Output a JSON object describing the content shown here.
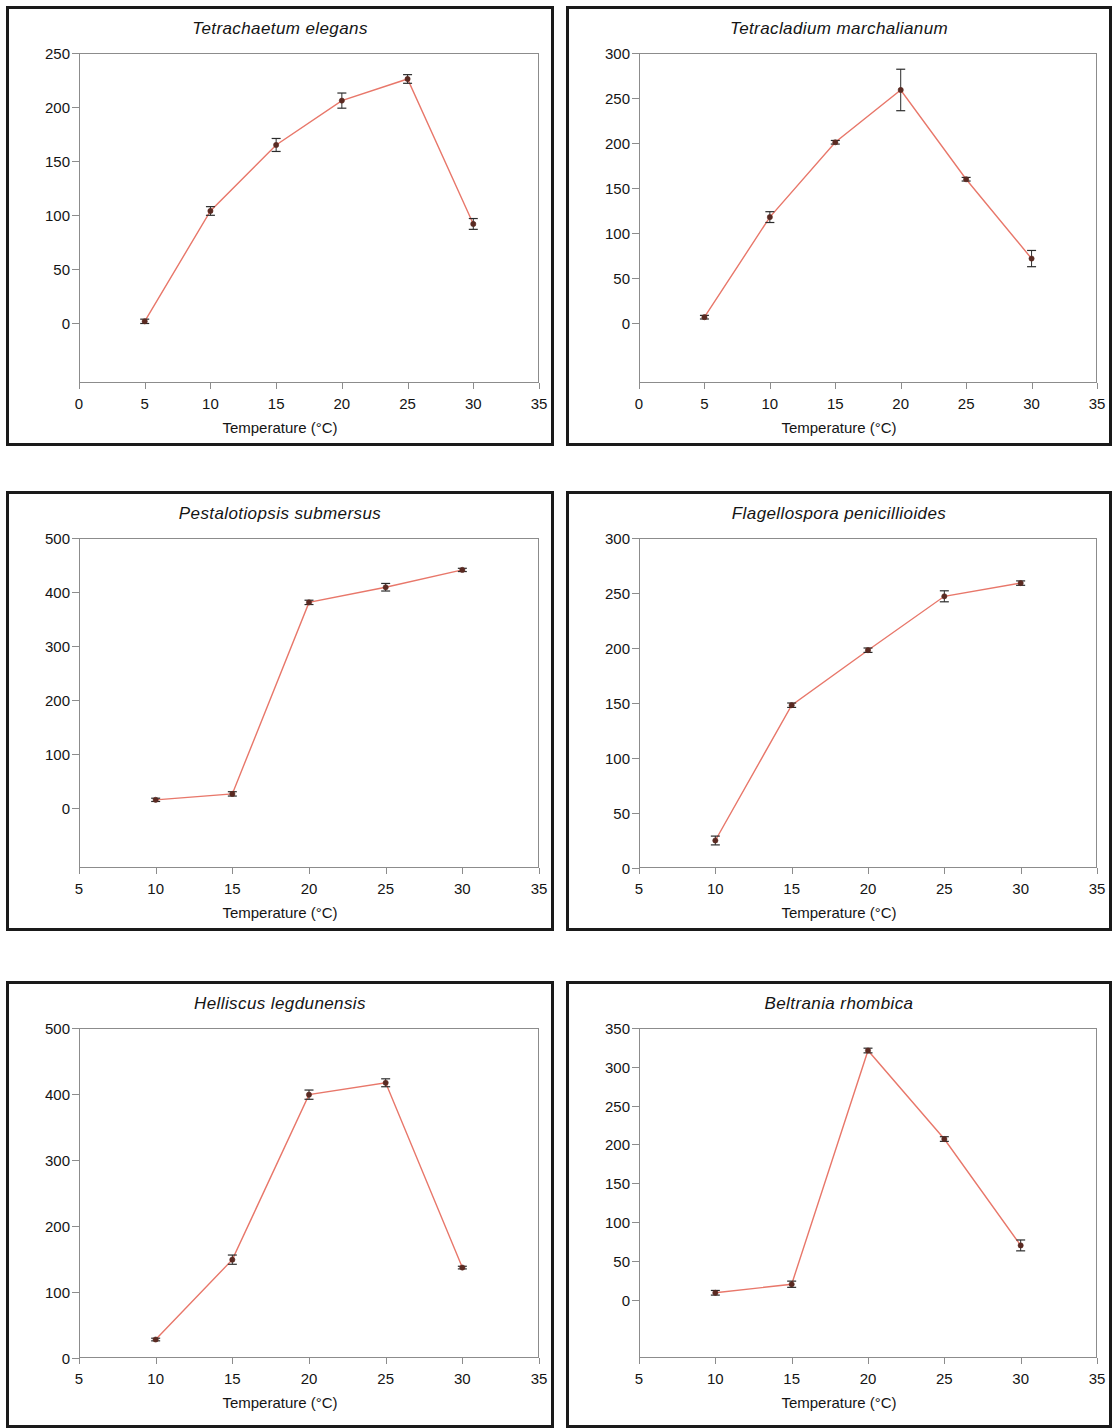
{
  "figure": {
    "x_axis_label": "Temperature (°C)",
    "line_color": "#e8776a",
    "marker_color": "#5a2a22",
    "error_bar_color": "#2b2b2b",
    "axis_color": "#8c8c8c",
    "frame_color": "#1a1a1a",
    "panel_count": 6
  },
  "chart_data": [
    {
      "id": "tetrachaetum-elegans",
      "type": "line",
      "title": "Tetrachaetum elegans",
      "xlabel": "Temperature (°C)",
      "ylabel": "",
      "xlim": [
        0,
        35
      ],
      "ylim": [
        -55,
        250
      ],
      "y_axis_display_min": 0,
      "xticks": [
        0,
        5,
        10,
        15,
        20,
        25,
        30,
        35
      ],
      "yticks": [
        0,
        50,
        100,
        150,
        200,
        250
      ],
      "grid": false,
      "legend": false,
      "x": [
        5,
        10,
        15,
        20,
        25,
        30
      ],
      "values": [
        2,
        104,
        165,
        206,
        226,
        92
      ],
      "errors": [
        2,
        4,
        6,
        7,
        4,
        5
      ]
    },
    {
      "id": "tetracladium-marchalianum",
      "type": "line",
      "title": "Tetracladium marchalianum",
      "xlabel": "Temperature (°C)",
      "ylabel": "",
      "xlim": [
        0,
        35
      ],
      "ylim": [
        -66,
        300
      ],
      "y_axis_display_min": 0,
      "xticks": [
        0,
        5,
        10,
        15,
        20,
        25,
        30,
        35
      ],
      "yticks": [
        0,
        50,
        100,
        150,
        200,
        250,
        300
      ],
      "grid": false,
      "legend": false,
      "x": [
        5,
        10,
        15,
        20,
        25,
        30
      ],
      "values": [
        7,
        118,
        201,
        259,
        160,
        72
      ],
      "errors": [
        2,
        6,
        2,
        23,
        2,
        9
      ]
    },
    {
      "id": "pestalotiopsis-submersus",
      "type": "line",
      "title": "Pestalotiopsis submersus",
      "xlabel": "Temperature (°C)",
      "ylabel": "",
      "xlim": [
        5,
        35
      ],
      "ylim": [
        -110,
        500
      ],
      "y_axis_display_min": 0,
      "xticks": [
        5,
        10,
        15,
        20,
        25,
        30,
        35
      ],
      "yticks": [
        0,
        100,
        200,
        300,
        400,
        500
      ],
      "grid": false,
      "legend": false,
      "x": [
        10,
        15,
        20,
        25,
        30
      ],
      "values": [
        16,
        27,
        381,
        409,
        441
      ],
      "errors": [
        3,
        4,
        4,
        7,
        3
      ]
    },
    {
      "id": "flagellospora-penicillioides",
      "type": "line",
      "title": "Flagellospora penicillioides",
      "xlabel": "Temperature (°C)",
      "ylabel": "",
      "xlim": [
        5,
        35
      ],
      "ylim": [
        0,
        300
      ],
      "y_axis_display_min": 0,
      "xticks": [
        5,
        10,
        15,
        20,
        25,
        30,
        35
      ],
      "yticks": [
        0,
        50,
        100,
        150,
        200,
        250,
        300
      ],
      "grid": false,
      "legend": false,
      "x": [
        10,
        15,
        20,
        25,
        30
      ],
      "values": [
        25,
        148,
        198,
        247,
        259
      ],
      "errors": [
        4,
        2,
        2,
        5,
        2
      ]
    },
    {
      "id": "helliscus-legdunensis",
      "type": "line",
      "title": "Helliscus legdunensis",
      "xlabel": "Temperature (°C)",
      "ylabel": "",
      "xlim": [
        5,
        35
      ],
      "ylim": [
        0,
        500
      ],
      "y_axis_display_min": 0,
      "xticks": [
        5,
        10,
        15,
        20,
        25,
        30,
        35
      ],
      "yticks": [
        0,
        100,
        200,
        300,
        400,
        500
      ],
      "grid": false,
      "legend": false,
      "x": [
        10,
        15,
        20,
        25,
        30
      ],
      "values": [
        28,
        149,
        399,
        417,
        137
      ],
      "errors": [
        2,
        7,
        7,
        6,
        2
      ]
    },
    {
      "id": "beltrania-rhombica",
      "type": "line",
      "title": "Beltrania rhombica",
      "xlabel": "Temperature (°C)",
      "ylabel": "",
      "xlim": [
        5,
        35
      ],
      "ylim": [
        -75,
        350
      ],
      "y_axis_display_min": 0,
      "xticks": [
        5,
        10,
        15,
        20,
        25,
        30,
        35
      ],
      "yticks": [
        0,
        50,
        100,
        150,
        200,
        250,
        300,
        350
      ],
      "grid": false,
      "legend": false,
      "x": [
        10,
        15,
        20,
        25,
        30
      ],
      "values": [
        9,
        20,
        321,
        207,
        70
      ],
      "errors": [
        3,
        4,
        3,
        3,
        7
      ]
    }
  ],
  "panels": [
    {
      "left": 6,
      "top": 6,
      "width": 548,
      "height": 440,
      "title_top": 10,
      "plot_left": 70,
      "plot_top": 44,
      "plot_width": 460,
      "plot_height": 330,
      "xlabel_top": 410
    },
    {
      "left": 566,
      "top": 6,
      "width": 546,
      "height": 440,
      "title_top": 10,
      "plot_left": 70,
      "plot_top": 44,
      "plot_width": 458,
      "plot_height": 330,
      "xlabel_top": 410
    },
    {
      "left": 6,
      "top": 491,
      "width": 548,
      "height": 440,
      "title_top": 10,
      "plot_left": 70,
      "plot_top": 44,
      "plot_width": 460,
      "plot_height": 330,
      "xlabel_top": 410
    },
    {
      "left": 566,
      "top": 491,
      "width": 546,
      "height": 440,
      "title_top": 10,
      "plot_left": 70,
      "plot_top": 44,
      "plot_width": 458,
      "plot_height": 330,
      "xlabel_top": 410
    },
    {
      "left": 6,
      "top": 981,
      "width": 548,
      "height": 447,
      "title_top": 10,
      "plot_left": 70,
      "plot_top": 44,
      "plot_width": 460,
      "plot_height": 330,
      "xlabel_top": 410
    },
    {
      "left": 566,
      "top": 981,
      "width": 546,
      "height": 447,
      "title_top": 10,
      "plot_left": 70,
      "plot_top": 44,
      "plot_width": 458,
      "plot_height": 330,
      "xlabel_top": 410
    }
  ]
}
